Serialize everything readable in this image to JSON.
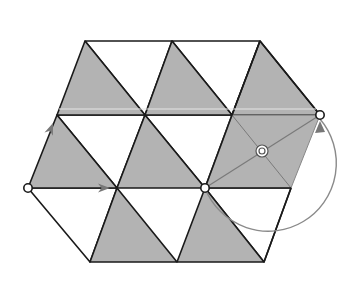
{
  "diagram": {
    "colors": {
      "shaded_fill": "#b3b3b3",
      "edge_stroke": "#1a1a1a",
      "overlay_fill": "#a6a6a6",
      "arrow_color": "#777777",
      "highlight_line": "#e6e6e6",
      "marker_fill": "#ffffff"
    },
    "vertices": {
      "A": [
        85,
        41
      ],
      "B": [
        172,
        41
      ],
      "C": [
        260,
        41
      ],
      "D": [
        57,
        115
      ],
      "E": [
        145,
        115
      ],
      "F": [
        232,
        115
      ],
      "G": [
        320,
        115
      ],
      "H": [
        28,
        188
      ],
      "I": [
        117,
        188
      ],
      "J": [
        205,
        188
      ],
      "K": [
        291,
        188
      ],
      "L": [
        90,
        262
      ],
      "M": [
        177,
        262
      ],
      "N": [
        264,
        262
      ]
    },
    "shaded_triangles": [
      [
        "A",
        "D",
        "E"
      ],
      [
        "B",
        "E",
        "F"
      ],
      [
        "C",
        "F",
        "G"
      ],
      [
        "D",
        "H",
        "I"
      ],
      [
        "E",
        "I",
        "J"
      ],
      [
        "I",
        "L",
        "M"
      ],
      [
        "J",
        "M",
        "N"
      ]
    ],
    "white_triangles": [
      [
        "A",
        "B",
        "E"
      ],
      [
        "B",
        "C",
        "F"
      ],
      [
        "D",
        "E",
        "I"
      ],
      [
        "E",
        "F",
        "J"
      ],
      [
        "H",
        "I",
        "L"
      ],
      [
        "J",
        "K",
        "N"
      ]
    ],
    "overlay_parallelogram": [
      "F",
      "G",
      "K",
      "J"
    ],
    "rotation_center": [
      262,
      151
    ],
    "markers": [
      {
        "id": "start-point",
        "at": [
          28,
          188
        ]
      },
      {
        "id": "rotation-pivot",
        "at": [
          205,
          188
        ]
      },
      {
        "id": "image-point",
        "at": [
          320,
          115
        ]
      }
    ],
    "translation_arrows": [
      {
        "id": "arrow-up",
        "from": [
          28,
          188
        ],
        "to": [
          53,
          123
        ]
      },
      {
        "id": "arrow-right",
        "from": [
          28,
          188
        ],
        "to": [
          110,
          188
        ]
      }
    ],
    "rotation_arc": {
      "center": [
        262,
        151
      ],
      "radius": 68
    }
  }
}
